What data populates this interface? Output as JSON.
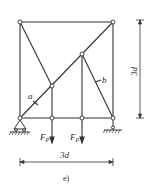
{
  "diagram": {
    "type": "truss",
    "caption": "e)",
    "labels": {
      "member_a": "a",
      "member_b": "b",
      "load_1": "F",
      "load_1_sub": "P",
      "load_2": "F",
      "load_2_sub": "P",
      "height_dim": "3d",
      "width_dim": "3d"
    },
    "nodes": [
      {
        "id": "top-left",
        "x": 20,
        "y": 22
      },
      {
        "id": "top-right",
        "x": 113,
        "y": 22
      },
      {
        "id": "mid-node",
        "x": 82,
        "y": 54
      },
      {
        "id": "low-node",
        "x": 52,
        "y": 86
      },
      {
        "id": "bottom-1",
        "x": 20,
        "y": 118
      },
      {
        "id": "bottom-2",
        "x": 52,
        "y": 118
      },
      {
        "id": "bottom-3",
        "x": 82,
        "y": 118
      },
      {
        "id": "bottom-4",
        "x": 113,
        "y": 118
      }
    ],
    "supports": [
      {
        "type": "pin",
        "node": "bottom-1"
      },
      {
        "type": "roller",
        "node": "bottom-4"
      }
    ],
    "loads": [
      {
        "node": "bottom-2",
        "label": "FP",
        "direction": "down"
      },
      {
        "node": "bottom-3",
        "label": "FP",
        "direction": "down"
      }
    ]
  }
}
